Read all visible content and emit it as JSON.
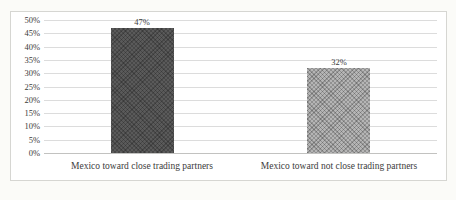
{
  "chart_data": {
    "type": "bar",
    "title": "",
    "xlabel": "",
    "ylabel": "",
    "categories": [
      "Mexico toward close trading partners",
      "Mexico toward not close trading partners"
    ],
    "values": [
      47,
      32
    ],
    "value_labels": [
      "47%",
      "32%"
    ],
    "ylim": [
      0,
      50
    ],
    "yticks": [
      0,
      5,
      10,
      15,
      20,
      25,
      30,
      35,
      40,
      45,
      50
    ],
    "ytick_labels": [
      "0%",
      "5%",
      "10%",
      "15%",
      "20%",
      "25%",
      "30%",
      "35%",
      "40%",
      "45%",
      "50%"
    ],
    "grid": "horizontal",
    "legend": "none",
    "bar_colors": [
      "#5a5a5a",
      "#b5b5b5"
    ],
    "gridline_color": "#dcdcdc",
    "axis_line_color": "#c2c2c0",
    "frame_border_color": "#d6d6d2",
    "text_color": "#3b3b3b",
    "plot_background": "#ffffff",
    "page_background": "#fbfbf8"
  }
}
